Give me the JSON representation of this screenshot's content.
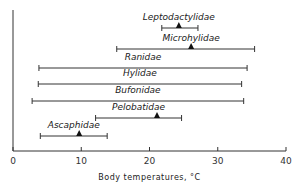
{
  "chart_data": {
    "type": "range",
    "title": "",
    "xlabel": "Body temperatures, °C",
    "ylabel": "",
    "xlim": [
      0,
      40
    ],
    "xticks": [
      0,
      10,
      20,
      30,
      40
    ],
    "grid": false,
    "series": [
      {
        "name": "Leptodactylidae",
        "min": 21.8,
        "max": 27.1,
        "mean": 24.3
      },
      {
        "name": "Microhylidae",
        "min": 15.2,
        "max": 35.4,
        "mean": 26.1
      },
      {
        "name": "Ranidae",
        "min": 3.8,
        "max": 34.3,
        "mean": null
      },
      {
        "name": "Hylidae",
        "min": 3.7,
        "max": 33.5,
        "mean": null
      },
      {
        "name": "Bufonidae",
        "min": 2.8,
        "max": 33.8,
        "mean": null
      },
      {
        "name": "Pelobatidae",
        "min": 12.1,
        "max": 24.7,
        "mean": 21.1
      },
      {
        "name": "Ascaphidae",
        "min": 4.0,
        "max": 13.8,
        "mean": 9.7
      }
    ]
  }
}
